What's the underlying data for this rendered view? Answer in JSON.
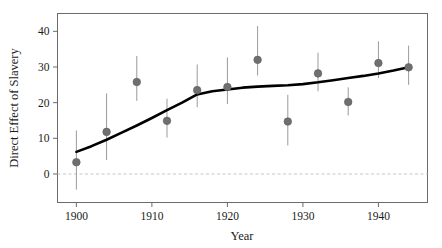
{
  "chart_data": {
    "type": "scatter",
    "title": "",
    "xlabel": "Year",
    "ylabel": "Direct Effect of Slavery",
    "xlim": [
      1897.5,
      1946.5
    ],
    "ylim": [
      -8,
      45
    ],
    "grid": false,
    "legend": null,
    "xticks": [
      1900,
      1910,
      1920,
      1930,
      1940
    ],
    "yticks": [
      0,
      10,
      20,
      30,
      40
    ],
    "zero_reference_line": {
      "y": 0,
      "style": "dashed",
      "color": "#c9c6c2"
    },
    "x": [
      1900,
      1904,
      1908,
      1912,
      1916,
      1920,
      1924,
      1928,
      1932,
      1936,
      1940,
      1944
    ],
    "values": [
      3.3,
      11.8,
      25.8,
      14.9,
      23.5,
      24.4,
      32.0,
      14.7,
      28.2,
      20.2,
      31.1,
      29.9
    ],
    "error_low": [
      -4.4,
      3.9,
      20.5,
      10.2,
      18.7,
      19.6,
      27.6,
      8.0,
      23.2,
      16.4,
      26.9,
      25.0
    ],
    "error_high": [
      12.2,
      22.6,
      33.1,
      21.1,
      30.7,
      32.7,
      41.5,
      22.2,
      34.0,
      24.3,
      37.2,
      36.0
    ],
    "marker": {
      "shape": "circle",
      "color": "#6f6f6f",
      "size": 5
    },
    "errorbar": {
      "color": "#9a9a9a",
      "width": 1
    },
    "trend_line": {
      "name": "smoothed trend",
      "color": "#000000",
      "width": 2.6,
      "x": [
        1900,
        1902,
        1904,
        1906,
        1908,
        1910,
        1912,
        1914,
        1916,
        1918,
        1920,
        1922,
        1924,
        1926,
        1928,
        1930,
        1932,
        1934,
        1936,
        1938,
        1940,
        1942,
        1944
      ],
      "y": [
        6.2,
        7.8,
        9.6,
        11.6,
        13.6,
        15.7,
        17.9,
        20.0,
        22.3,
        23.2,
        23.7,
        24.2,
        24.5,
        24.7,
        24.9,
        25.2,
        25.7,
        26.3,
        26.9,
        27.5,
        28.2,
        29.0,
        29.9
      ]
    }
  },
  "axes": {
    "x_tick_labels": [
      "1900",
      "1910",
      "1920",
      "1930",
      "1940"
    ],
    "y_tick_labels": [
      "0",
      "10",
      "20",
      "30",
      "40"
    ],
    "x_axis_title": "Year",
    "y_axis_title": "Direct Effect of Slavery"
  },
  "colors": {
    "frame": "#6b6b6b",
    "marker": "#6f6f6f",
    "errorbar": "#9a9a9a",
    "trend": "#000000",
    "zero_line": "#c9c6c2",
    "background": "#ffffff",
    "text": "#1a1a1a"
  }
}
